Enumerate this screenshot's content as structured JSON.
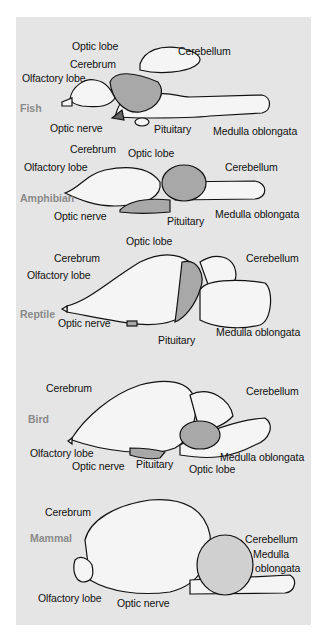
{
  "figure": {
    "background": "#e5e5e5",
    "colors": {
      "brain_fill": "#f5f5f5",
      "optic_lobe_fill": "#a8a8a8",
      "outline": "#111111",
      "species_label": "#8a8a8a"
    }
  },
  "panels": [
    {
      "species": "Fish",
      "labels": [
        "Optic lobe",
        "Cerebellum",
        "Cerebrum",
        "Olfactory lobe",
        "Optic nerve",
        "Pituitary",
        "Medulla oblongata"
      ]
    },
    {
      "species": "Amphibian",
      "labels": [
        "Cerebrum",
        "Optic lobe",
        "Olfactory lobe",
        "Cerebellum",
        "Optic nerve",
        "Pituitary",
        "Medulla oblongata"
      ]
    },
    {
      "species": "Reptile",
      "labels": [
        "Optic lobe",
        "Cerebrum",
        "Cerebellum",
        "Olfactory lobe",
        "Optic nerve",
        "Medulla oblongata",
        "Pituitary"
      ]
    },
    {
      "species": "Bird",
      "labels": [
        "Cerebrum",
        "Cerebellum",
        "Olfactory lobe",
        "Medulla oblongata",
        "Optic nerve",
        "Pituitary",
        "Optic lobe"
      ]
    },
    {
      "species": "Mammal",
      "labels": [
        "Cerebrum",
        "Cerebellum",
        "Medulla",
        "oblongata",
        "Olfactory lobe",
        "Optic nerve"
      ]
    }
  ]
}
